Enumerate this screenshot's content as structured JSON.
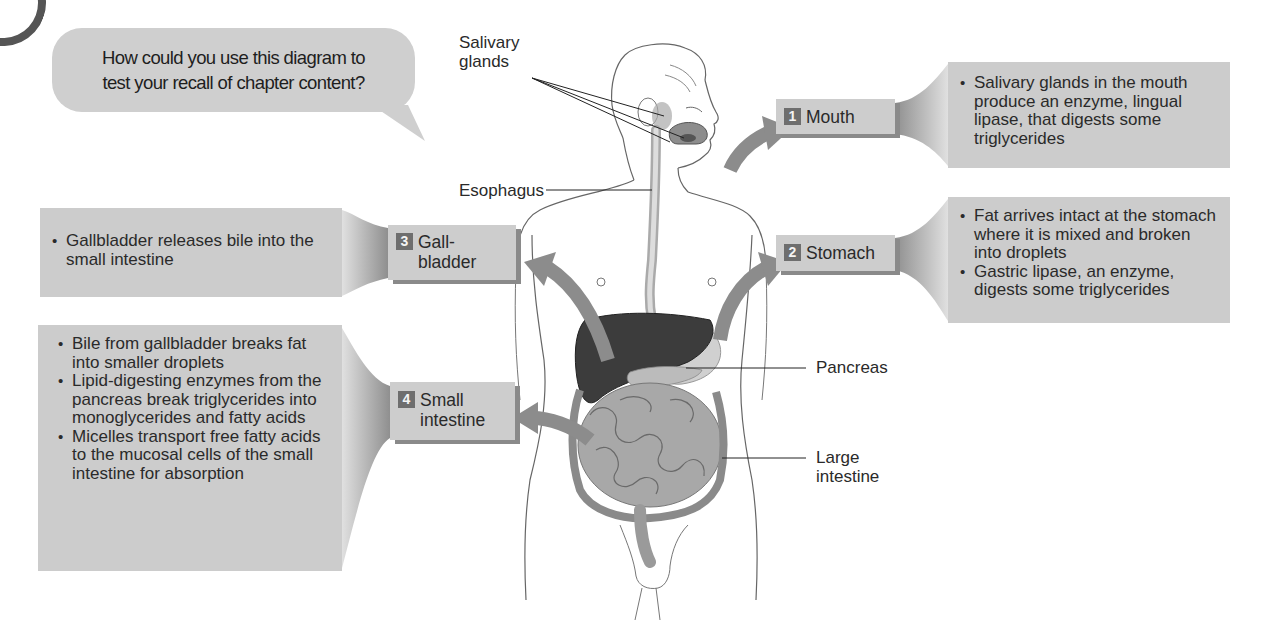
{
  "question_bubble": {
    "line1": "How could you use this diagram to",
    "line2": "test your recall of chapter content?"
  },
  "steps": [
    {
      "number": "1",
      "label_line1": "Mouth",
      "label_line2": "",
      "points": [
        "Salivary glands in the mouth produce an enzyme, lingual lipase, that digests some triglycerides"
      ]
    },
    {
      "number": "2",
      "label_line1": "Stomach",
      "label_line2": "",
      "points": [
        "Fat arrives intact at the stomach where it is mixed and broken into droplets",
        "Gastric lipase, an enzyme, digests some triglycerides"
      ]
    },
    {
      "number": "3",
      "label_line1": "Gall-",
      "label_line2": "bladder",
      "points": [
        "Gallbladder releases bile into the small intestine"
      ]
    },
    {
      "number": "4",
      "label_line1": "Small",
      "label_line2": "intestine",
      "points": [
        "Bile from gallbladder breaks fat into smaller droplets",
        "Lipid-digesting enzymes from the pancreas break triglycerides into monoglycerides and fatty acids",
        "Micelles transport free fatty acids to the mucosal cells of the small intestine for absorption"
      ]
    }
  ],
  "anatomy_labels": {
    "salivary_line1": "Salivary",
    "salivary_line2": "glands",
    "esophagus": "Esophagus",
    "pancreas": "Pancreas",
    "large_intestine_line1": "Large",
    "large_intestine_line2": "intestine"
  },
  "colors": {
    "box_fill": "#cccccc",
    "number_badge": "#6e6e6e",
    "arrow": "#8c8c8c",
    "liver": "#3c3c3c"
  }
}
